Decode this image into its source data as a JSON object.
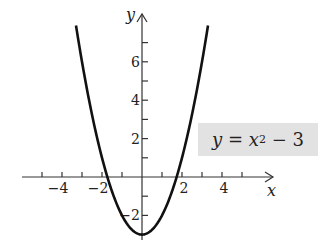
{
  "chart_data": {
    "type": "line",
    "title": "",
    "equation_label": "y = x² − 3",
    "xlabel": "x",
    "ylabel": "y",
    "xlim": [
      -5.3,
      6.5
    ],
    "ylim": [
      -3.3,
      8.2
    ],
    "x_tick_labels": [
      "−4",
      "−2",
      "2",
      "4"
    ],
    "x_tick_values": [
      -4,
      -2,
      2,
      4
    ],
    "x_minor_ticks": [
      -5,
      -4,
      -3,
      -2,
      -1,
      1,
      2,
      3,
      4,
      5
    ],
    "y_tick_labels": [
      "−2",
      "2",
      "4",
      "6"
    ],
    "y_tick_values": [
      -2,
      2,
      4,
      6
    ],
    "y_minor_ticks": [
      -2,
      -1,
      1,
      2,
      3,
      4,
      5,
      6,
      7
    ],
    "grid": false,
    "series": [
      {
        "name": "y = x^2 - 3",
        "function": "x^2 - 3",
        "x": [
          -3.3,
          -3,
          -2.5,
          -2,
          -1.5,
          -1,
          -0.5,
          0,
          0.5,
          1,
          1.5,
          2,
          2.5,
          3,
          3.3
        ],
        "y": [
          7.89,
          6,
          3.25,
          1,
          -0.75,
          -2,
          -2.75,
          -3,
          -2.75,
          -2,
          -0.75,
          1,
          3.25,
          6,
          7.89
        ]
      }
    ]
  },
  "labels": {
    "eq_y": "y",
    "eq_eq": " = ",
    "eq_x": "x",
    "eq_exp": "2",
    "eq_rest": " − 3"
  }
}
